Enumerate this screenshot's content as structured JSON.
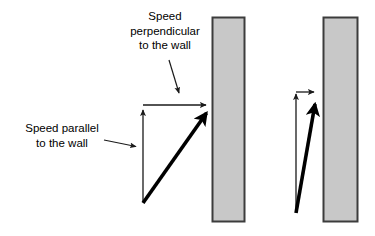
{
  "figure": {
    "title_text": "",
    "background_color": "#ffffff",
    "width": 375,
    "height": 236
  },
  "labels": {
    "perpendicular": "Speed\nperpendicular\nto the wall",
    "parallel": "Speed parallel\nto the wall"
  },
  "colors": {
    "wall_fill": "#c8c8c8",
    "wall_border": "#3c3c3c",
    "vector_thin": "#1a1a1a",
    "vector_thick": "#000000",
    "pointer": "#1a1a1a",
    "text": "#000000"
  },
  "diagram_left": {
    "name": "oblique-impact",
    "wall": {
      "x": 212,
      "y": 17,
      "width": 33,
      "height": 205
    },
    "vectors": {
      "parallel_component": {
        "from_x": 143,
        "from_y": 202,
        "to_x": 143,
        "to_y": 109,
        "style": "thin",
        "direction": "up"
      },
      "perpendicular_component": {
        "from_x": 143,
        "from_y": 105,
        "to_x": 209,
        "to_y": 105,
        "style": "thin",
        "direction": "right"
      },
      "resultant_velocity": {
        "from_x": 143,
        "from_y": 203,
        "to_x": 211,
        "to_y": 107,
        "style": "thick",
        "direction": "up-right"
      }
    }
  },
  "diagram_right": {
    "name": "glancing-impact",
    "wall": {
      "x": 323,
      "y": 17,
      "width": 35,
      "height": 205
    },
    "vectors": {
      "parallel_component": {
        "from_x": 296,
        "from_y": 212,
        "to_x": 296,
        "to_y": 93,
        "style": "thin",
        "direction": "up"
      },
      "perpendicular_component": {
        "from_x": 296,
        "from_y": 92,
        "to_x": 317,
        "to_y": 92,
        "style": "thin",
        "direction": "right"
      },
      "resultant_velocity": {
        "from_x": 296,
        "from_y": 213,
        "to_x": 317,
        "to_y": 95,
        "style": "thick",
        "direction": "up-right"
      }
    }
  },
  "pointers": {
    "perpendicular_pointer": {
      "from_x": 169,
      "from_y": 60,
      "to_x": 180,
      "to_y": 98
    },
    "parallel_pointer": {
      "from_x": 104,
      "from_y": 140,
      "to_x": 140,
      "to_y": 147
    }
  }
}
